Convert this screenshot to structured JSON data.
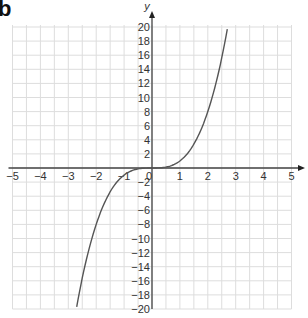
{
  "panel_label": "b",
  "chart_data": {
    "type": "line",
    "title": "",
    "function": "y = x^3",
    "xlabel": "",
    "ylabel": "y",
    "xlim": [
      -5,
      5
    ],
    "ylim": [
      -20,
      20
    ],
    "grid": true,
    "x_ticks": [
      "-5",
      "-4",
      "-3",
      "-2",
      "-1",
      "0",
      "1",
      "2",
      "3",
      "4",
      "5"
    ],
    "y_ticks": [
      "20",
      "18",
      "16",
      "14",
      "12",
      "10",
      "8",
      "6",
      "4",
      "2",
      "-2",
      "-4",
      "-6",
      "-8",
      "-10",
      "-12",
      "-14",
      "-16",
      "-18",
      "-20"
    ],
    "series": [
      {
        "name": "y = x^3",
        "x": [
          -2.7,
          -2.5,
          -2,
          -1.5,
          -1,
          -0.5,
          0,
          0.5,
          1,
          1.5,
          2,
          2.5,
          2.7
        ],
        "y": [
          -19.7,
          -15.6,
          -8,
          -3.4,
          -1,
          -0.1,
          0,
          0.1,
          1,
          3.4,
          8,
          15.6,
          19.7
        ]
      }
    ],
    "colors": {
      "curve": "#555555",
      "grid": "#dddddd",
      "axis": "#444444"
    }
  }
}
